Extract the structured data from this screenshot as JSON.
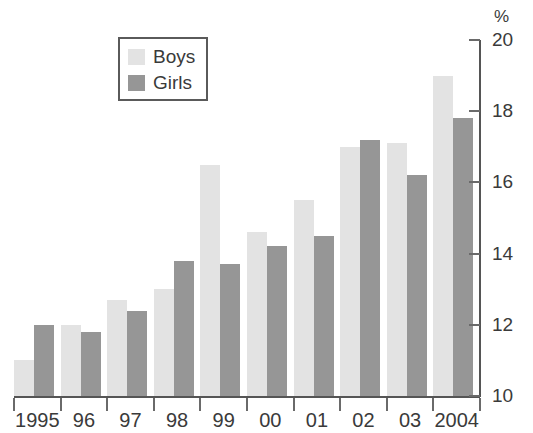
{
  "chart_data": {
    "type": "bar",
    "title": "",
    "subtitle": "",
    "xlabel": "",
    "ylabel": "%",
    "ylim": [
      10,
      20
    ],
    "ytick_values": [
      10,
      12,
      14,
      16,
      18,
      20
    ],
    "ytick_labels": [
      "10",
      "12",
      "14",
      "16",
      "18",
      "20"
    ],
    "grid": false,
    "legend_position": "top-left",
    "unit_symbol": "%",
    "categories": [
      "1995",
      "96",
      "97",
      "98",
      "99",
      "00",
      "01",
      "02",
      "03",
      "2004"
    ],
    "series": [
      {
        "name": "Boys",
        "color": "#e3e3e3",
        "values": [
          11.0,
          12.0,
          12.7,
          13.0,
          16.5,
          14.6,
          15.5,
          17.0,
          17.1,
          19.0
        ]
      },
      {
        "name": "Girls",
        "color": "#969696",
        "values": [
          12.0,
          11.8,
          12.4,
          13.8,
          13.7,
          14.2,
          14.5,
          17.2,
          16.2,
          17.8
        ]
      }
    ]
  },
  "legend": {
    "entries": [
      {
        "label": "Boys",
        "swatch": "boys"
      },
      {
        "label": "Girls",
        "swatch": "girls"
      }
    ]
  },
  "axis": {
    "percent_symbol": "%"
  }
}
